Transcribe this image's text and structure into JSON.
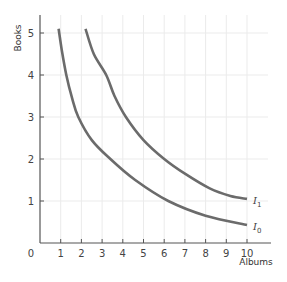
{
  "chart_data": {
    "type": "line",
    "title": "",
    "xlabel": "Albums",
    "ylabel": "Books",
    "xlim": [
      0,
      10.5
    ],
    "ylim": [
      0,
      5.4
    ],
    "x_ticks": [
      1,
      2,
      3,
      4,
      5,
      6,
      7,
      8,
      9,
      10
    ],
    "y_ticks": [
      1,
      2,
      3,
      4,
      5
    ],
    "origin_label": "0",
    "grid": true,
    "series": [
      {
        "name": "I0",
        "label": "I",
        "subscript": "0",
        "color": "#6b6b6b",
        "points": [
          [
            0.9,
            5.1
          ],
          [
            1.05,
            4.6
          ],
          [
            1.27,
            4.0
          ],
          [
            1.55,
            3.45
          ],
          [
            1.85,
            3.0
          ],
          [
            2.5,
            2.45
          ],
          [
            3.4,
            2.0
          ],
          [
            4.6,
            1.5
          ],
          [
            6.2,
            1.0
          ],
          [
            8.0,
            0.65
          ],
          [
            10.0,
            0.43
          ]
        ]
      },
      {
        "name": "I1",
        "label": "I",
        "subscript": "1",
        "color": "#6b6b6b",
        "points": [
          [
            2.2,
            5.1
          ],
          [
            2.6,
            4.5
          ],
          [
            3.2,
            4.0
          ],
          [
            3.6,
            3.5
          ],
          [
            4.15,
            3.0
          ],
          [
            5.0,
            2.45
          ],
          [
            6.0,
            2.0
          ],
          [
            7.0,
            1.65
          ],
          [
            8.2,
            1.3
          ],
          [
            9.2,
            1.12
          ],
          [
            10.0,
            1.05
          ]
        ]
      }
    ]
  },
  "layout": {
    "origin_px": [
      40,
      243
    ],
    "x_unit_px": 20.7,
    "y_unit_px": 42,
    "x_axis_end_px": 271,
    "y_axis_top_px": 15,
    "grid_right_px": 268,
    "axis_color": "#555555",
    "grid_color": "#ebebeb"
  }
}
